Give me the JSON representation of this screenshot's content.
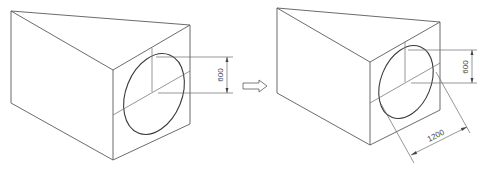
{
  "figures": [
    {
      "id": "before",
      "dimensions": [
        {
          "label": "600",
          "orientation": "vertical"
        }
      ]
    },
    {
      "id": "after",
      "dimensions": [
        {
          "label": "600",
          "orientation": "vertical"
        },
        {
          "label": "1200",
          "orientation": "diagonal"
        }
      ]
    }
  ],
  "transition_icon": "right-arrow-icon",
  "colors": {
    "line": "#5a5a5a",
    "ellipse": "#3a3a3a",
    "background": "#ffffff"
  }
}
